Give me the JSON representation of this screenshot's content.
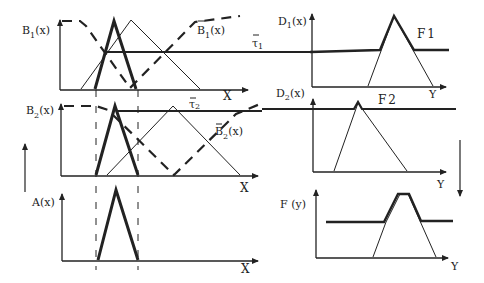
{
  "diagram": {
    "panels": {
      "b1": {
        "ylabel": "B",
        "ylabel_sub": "1",
        "ylabel_tail": "(x)",
        "xlabel": "X",
        "complement_label": "B",
        "complement_sub": "1",
        "complement_tail": "(x)",
        "threshold_label": "τ",
        "threshold_sub": "1"
      },
      "b2": {
        "ylabel": "B",
        "ylabel_sub": "2",
        "ylabel_tail": "(x)",
        "xlabel": "X",
        "complement_label": "B",
        "complement_sub": "2",
        "complement_tail": "(x)",
        "threshold_label": "τ",
        "threshold_sub": "2"
      },
      "a": {
        "ylabel": "A(x)",
        "xlabel": "X"
      },
      "d1": {
        "ylabel": "D",
        "ylabel_sub": "1",
        "ylabel_tail": "(x)",
        "xlabel": "Y",
        "fuzzy_label": "F",
        "fuzzy_sub": "1"
      },
      "d2": {
        "ylabel": "D",
        "ylabel_sub": "2",
        "ylabel_tail": "(x)",
        "xlabel": "Y",
        "fuzzy_label": "F",
        "fuzzy_sub": "2"
      },
      "f": {
        "ylabel": "F (y)",
        "xlabel": "Y"
      }
    },
    "colors": {
      "stroke": "#222222",
      "background": "#ffffff"
    }
  }
}
